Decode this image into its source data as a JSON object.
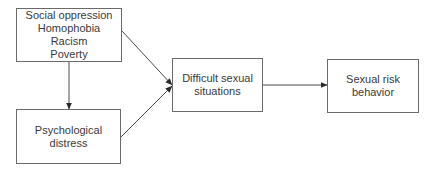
{
  "diagram": {
    "type": "path-model",
    "colors": {
      "line": "#4a4a4a",
      "border": "#6a6a6a",
      "text": "#3a3a3a",
      "background": "#ffffff"
    },
    "nodes": [
      {
        "id": "social-oppression",
        "lines": [
          "Social oppression",
          "Homophobia",
          "Racism",
          "Poverty"
        ]
      },
      {
        "id": "psychological-distress",
        "lines": [
          "Psychological",
          "distress"
        ]
      },
      {
        "id": "difficult-sexual-situations",
        "lines": [
          "Difficult sexual",
          "situations"
        ]
      },
      {
        "id": "sexual-risk-behavior",
        "lines": [
          "Sexual risk",
          "behavior"
        ]
      }
    ],
    "edges": [
      {
        "from": "social-oppression",
        "to": "psychological-distress"
      },
      {
        "from": "social-oppression",
        "to": "difficult-sexual-situations"
      },
      {
        "from": "psychological-distress",
        "to": "difficult-sexual-situations"
      },
      {
        "from": "difficult-sexual-situations",
        "to": "sexual-risk-behavior"
      }
    ]
  }
}
